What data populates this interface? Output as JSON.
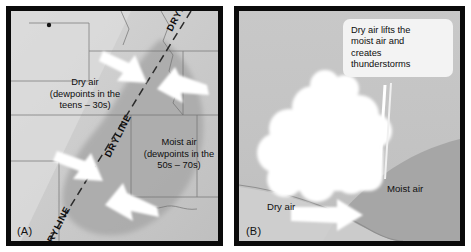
{
  "figure": {
    "type": "two-panel-weather-diagram",
    "background_color": "#ffffff",
    "border_color": "#0a0a0a"
  },
  "panel_a": {
    "letter": "(A)",
    "background_color": "#c9c9c9",
    "dry_air_label": {
      "line1": "Dry air",
      "line2": "(dewpoints in the",
      "line3": "teens – 30s)"
    },
    "moist_air_label": {
      "line1": "Moist air",
      "line2": "(dewpoints in the",
      "line3": "50s – 70s)"
    },
    "dryline_labels": [
      "DRYLINE",
      "DRYLINE",
      "DRYLINE"
    ],
    "arrow_color": "#ffffff",
    "arrows": [
      {
        "name": "dry-air-arrow-upper",
        "direction": "southeast"
      },
      {
        "name": "dry-air-arrow-lower",
        "direction": "southeast"
      },
      {
        "name": "moist-air-arrow-upper",
        "direction": "northwest"
      },
      {
        "name": "moist-air-arrow-lower",
        "direction": "northwest"
      }
    ]
  },
  "panel_b": {
    "letter": "(B)",
    "background_color": "#c4c4c4",
    "callout": {
      "line1": "Dry air lifts the",
      "line2": "moist air and",
      "line3": "creates",
      "line4": "thunderstorms"
    },
    "dry_air_label": "Dry air",
    "moist_air_label": "Moist air",
    "cloud_color": "#ffffff",
    "moist_wedge_color": "#a6a6a6",
    "arrow": {
      "name": "dry-air-arrow",
      "direction": "east",
      "color": "#ffffff"
    }
  }
}
